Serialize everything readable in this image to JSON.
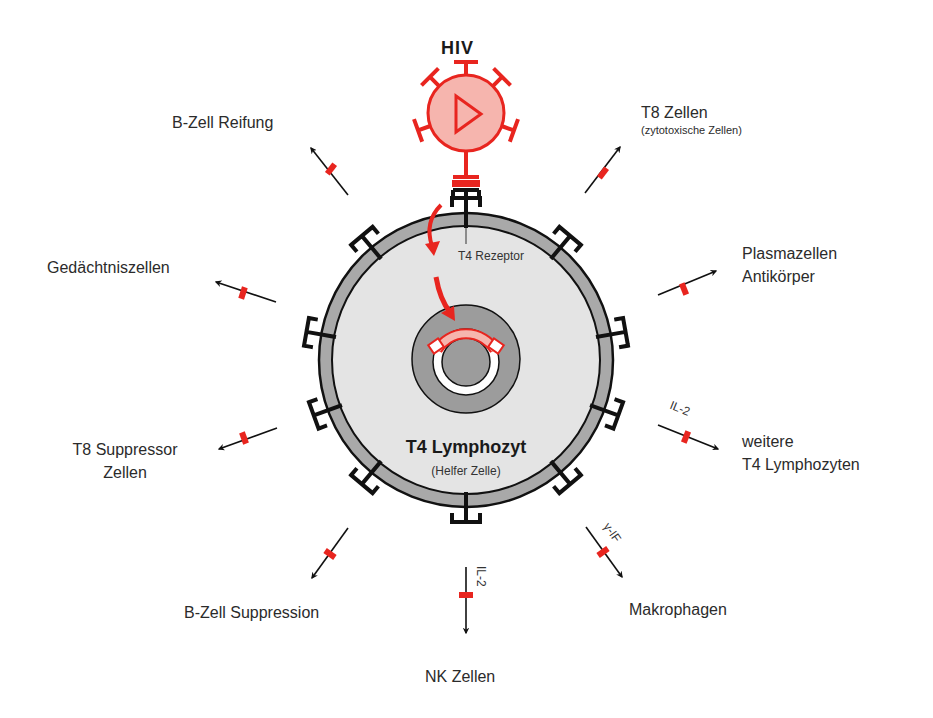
{
  "virus": {
    "label": "HIV"
  },
  "cell": {
    "title": "T4 Lymphozyt",
    "subtitle": "(Helfer Zelle)",
    "receptor_label": "T4 Rezeptor"
  },
  "targets": [
    {
      "id": "b-zell-reifung",
      "lines": [
        "B-Zell Reifung"
      ]
    },
    {
      "id": "t8-zellen",
      "lines": [
        "T8 Zellen"
      ],
      "sub": "(zytotoxische Zellen)"
    },
    {
      "id": "plasmazellen",
      "lines": [
        "Plasmazellen",
        "Antikörper"
      ]
    },
    {
      "id": "weitere-t4",
      "lines": [
        "weitere",
        "T4 Lymphozyten"
      ],
      "signal": "IL-2"
    },
    {
      "id": "makrophagen",
      "lines": [
        "Makrophagen"
      ],
      "signal": "γ-IF"
    },
    {
      "id": "nk-zellen",
      "lines": [
        "NK Zellen"
      ],
      "signal": "IL-2"
    },
    {
      "id": "b-zell-suppression",
      "lines": [
        "B-Zell Suppression"
      ]
    },
    {
      "id": "t8-suppressor",
      "lines": [
        "T8 Suppressor",
        "Zellen"
      ]
    },
    {
      "id": "gedaechtniszellen",
      "lines": [
        "Gedächtniszellen"
      ]
    }
  ],
  "colors": {
    "virus_red": "#e8251f",
    "virus_fill": "#f6b5ae",
    "membrane_gray": "#a9a9a9",
    "cytoplasm": "#e4e4e4",
    "nucleus_gray": "#9c9c9c",
    "receptor_black": "#111111"
  }
}
